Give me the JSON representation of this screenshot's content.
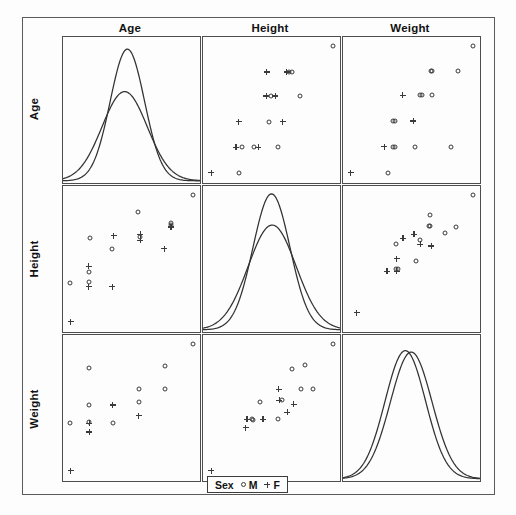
{
  "figure": {
    "title": "",
    "variables": [
      "Age",
      "Height",
      "Weight"
    ],
    "column_headers": [
      "Age",
      "Height",
      "Weight"
    ],
    "row_labels": [
      "Age",
      "Height",
      "Weight"
    ]
  },
  "legend": {
    "title": "Sex",
    "entries": [
      {
        "label": "M",
        "marker": "open-circle"
      },
      {
        "label": "F",
        "marker": "plus"
      }
    ]
  },
  "colors": {
    "frame": "#5a5a5a",
    "panel_border": "#4d4d4d",
    "curve": "#333333",
    "marker": "#3a3a3a",
    "background": "#fdfdfd",
    "text": "#111111"
  },
  "chart_data": {
    "type": "scatter",
    "title": "",
    "subtitle": "",
    "xlabel": "",
    "ylabel": "",
    "grid": false,
    "legend_position": "bottom-center",
    "matrix": {
      "kind": "scatterplot-matrix",
      "rows": 3,
      "cols": 3,
      "variables": [
        "Age",
        "Height",
        "Weight"
      ],
      "diagonal_plot": "density",
      "groups": [
        "M",
        "F"
      ]
    },
    "panels": [
      {
        "row": 0,
        "col": 0,
        "xvar": "Age",
        "yvar": "Age",
        "type": "density",
        "series": [
          {
            "name": "M",
            "marker": "open-circle",
            "peak_x": 0.47,
            "peak_y": 0.93,
            "sigma": 0.125
          },
          {
            "name": "F",
            "marker": "plus",
            "peak_x": 0.45,
            "peak_y": 0.63,
            "sigma": 0.165
          }
        ]
      },
      {
        "row": 0,
        "col": 1,
        "xvar": "Height",
        "yvar": "Age",
        "type": "scatter",
        "points": [
          {
            "x": 0.955,
            "y": 0.955,
            "g": "M"
          },
          {
            "x": 0.455,
            "y": 0.775,
            "g": "F"
          },
          {
            "x": 0.625,
            "y": 0.775,
            "g": "M"
          },
          {
            "x": 0.648,
            "y": 0.775,
            "g": "M"
          },
          {
            "x": 0.608,
            "y": 0.775,
            "g": "F"
          },
          {
            "x": 0.452,
            "y": 0.605,
            "g": "F"
          },
          {
            "x": 0.487,
            "y": 0.605,
            "g": "M"
          },
          {
            "x": 0.522,
            "y": 0.605,
            "g": "F"
          },
          {
            "x": 0.705,
            "y": 0.605,
            "g": "M"
          },
          {
            "x": 0.245,
            "y": 0.425,
            "g": "F"
          },
          {
            "x": 0.47,
            "y": 0.425,
            "g": "M"
          },
          {
            "x": 0.578,
            "y": 0.425,
            "g": "F"
          },
          {
            "x": 0.225,
            "y": 0.245,
            "g": "F"
          },
          {
            "x": 0.268,
            "y": 0.245,
            "g": "M"
          },
          {
            "x": 0.358,
            "y": 0.245,
            "g": "M"
          },
          {
            "x": 0.392,
            "y": 0.245,
            "g": "F"
          },
          {
            "x": 0.545,
            "y": 0.245,
            "g": "M"
          },
          {
            "x": 0.04,
            "y": 0.065,
            "g": "F"
          },
          {
            "x": 0.245,
            "y": 0.062,
            "g": "M"
          }
        ]
      },
      {
        "row": 0,
        "col": 2,
        "xvar": "Weight",
        "yvar": "Age",
        "type": "scatter",
        "points": [
          {
            "x": 0.955,
            "y": 0.955,
            "g": "M"
          },
          {
            "x": 0.638,
            "y": 0.78,
            "g": "M"
          },
          {
            "x": 0.648,
            "y": 0.78,
            "g": "M"
          },
          {
            "x": 0.845,
            "y": 0.78,
            "g": "M"
          },
          {
            "x": 0.425,
            "y": 0.61,
            "g": "F"
          },
          {
            "x": 0.56,
            "y": 0.61,
            "g": "M"
          },
          {
            "x": 0.57,
            "y": 0.61,
            "g": "M"
          },
          {
            "x": 0.645,
            "y": 0.61,
            "g": "M"
          },
          {
            "x": 0.355,
            "y": 0.43,
            "g": "M"
          },
          {
            "x": 0.365,
            "y": 0.43,
            "g": "M"
          },
          {
            "x": 0.505,
            "y": 0.43,
            "g": "F"
          },
          {
            "x": 0.288,
            "y": 0.25,
            "g": "F"
          },
          {
            "x": 0.352,
            "y": 0.25,
            "g": "M"
          },
          {
            "x": 0.368,
            "y": 0.25,
            "g": "M"
          },
          {
            "x": 0.518,
            "y": 0.25,
            "g": "M"
          },
          {
            "x": 0.79,
            "y": 0.25,
            "g": "M"
          },
          {
            "x": 0.035,
            "y": 0.065,
            "g": "F"
          },
          {
            "x": 0.318,
            "y": 0.062,
            "g": "M"
          }
        ]
      },
      {
        "row": 1,
        "col": 0,
        "xvar": "Age",
        "yvar": "Height",
        "type": "scatter",
        "points": [
          {
            "x": 0.955,
            "y": 0.955,
            "g": "M"
          },
          {
            "x": 0.545,
            "y": 0.835,
            "g": "M"
          },
          {
            "x": 0.79,
            "y": 0.745,
            "g": "M"
          },
          {
            "x": 0.79,
            "y": 0.758,
            "g": "M"
          },
          {
            "x": 0.79,
            "y": 0.732,
            "g": "F"
          },
          {
            "x": 0.178,
            "y": 0.655,
            "g": "M"
          },
          {
            "x": 0.358,
            "y": 0.672,
            "g": "F"
          },
          {
            "x": 0.558,
            "y": 0.66,
            "g": "M"
          },
          {
            "x": 0.558,
            "y": 0.64,
            "g": "F"
          },
          {
            "x": 0.558,
            "y": 0.68,
            "g": "F"
          },
          {
            "x": 0.345,
            "y": 0.58,
            "g": "M"
          },
          {
            "x": 0.74,
            "y": 0.58,
            "g": "F"
          },
          {
            "x": 0.172,
            "y": 0.455,
            "g": "F"
          },
          {
            "x": 0.172,
            "y": 0.418,
            "g": "M"
          },
          {
            "x": 0.172,
            "y": 0.348,
            "g": "M"
          },
          {
            "x": 0.172,
            "y": 0.312,
            "g": "F"
          },
          {
            "x": 0.348,
            "y": 0.312,
            "g": "F"
          },
          {
            "x": 0.03,
            "y": 0.335,
            "g": "M"
          },
          {
            "x": 0.035,
            "y": 0.065,
            "g": "F"
          }
        ]
      },
      {
        "row": 1,
        "col": 1,
        "xvar": "Height",
        "yvar": "Height",
        "type": "density",
        "series": [
          {
            "name": "M",
            "marker": "open-circle",
            "peak_x": 0.5,
            "peak_y": 0.96,
            "sigma": 0.135
          },
          {
            "name": "F",
            "marker": "plus",
            "peak_x": 0.505,
            "peak_y": 0.74,
            "sigma": 0.175
          }
        ]
      },
      {
        "row": 1,
        "col": 2,
        "xvar": "Weight",
        "yvar": "Height",
        "type": "scatter",
        "points": [
          {
            "x": 0.955,
            "y": 0.955,
            "g": "M"
          },
          {
            "x": 0.632,
            "y": 0.815,
            "g": "M"
          },
          {
            "x": 0.622,
            "y": 0.742,
            "g": "M"
          },
          {
            "x": 0.632,
            "y": 0.742,
            "g": "M"
          },
          {
            "x": 0.828,
            "y": 0.735,
            "g": "M"
          },
          {
            "x": 0.745,
            "y": 0.688,
            "g": "M"
          },
          {
            "x": 0.512,
            "y": 0.682,
            "g": "F"
          },
          {
            "x": 0.428,
            "y": 0.652,
            "g": "F"
          },
          {
            "x": 0.558,
            "y": 0.638,
            "g": "M"
          },
          {
            "x": 0.558,
            "y": 0.61,
            "g": "F"
          },
          {
            "x": 0.375,
            "y": 0.612,
            "g": "M"
          },
          {
            "x": 0.64,
            "y": 0.598,
            "g": "F"
          },
          {
            "x": 0.382,
            "y": 0.508,
            "g": "F"
          },
          {
            "x": 0.528,
            "y": 0.492,
            "g": "M"
          },
          {
            "x": 0.378,
            "y": 0.435,
            "g": "M"
          },
          {
            "x": 0.392,
            "y": 0.435,
            "g": "M"
          },
          {
            "x": 0.308,
            "y": 0.42,
            "g": "F"
          },
          {
            "x": 0.382,
            "y": 0.42,
            "g": "F"
          },
          {
            "x": 0.082,
            "y": 0.128,
            "g": "F"
          }
        ]
      },
      {
        "row": 2,
        "col": 0,
        "xvar": "Age",
        "yvar": "Weight",
        "type": "scatter",
        "points": [
          {
            "x": 0.955,
            "y": 0.955,
            "g": "M"
          },
          {
            "x": 0.175,
            "y": 0.79,
            "g": "M"
          },
          {
            "x": 0.742,
            "y": 0.8,
            "g": "M"
          },
          {
            "x": 0.548,
            "y": 0.642,
            "g": "M"
          },
          {
            "x": 0.742,
            "y": 0.642,
            "g": "M"
          },
          {
            "x": 0.548,
            "y": 0.552,
            "g": "M"
          },
          {
            "x": 0.175,
            "y": 0.528,
            "g": "M"
          },
          {
            "x": 0.352,
            "y": 0.528,
            "g": "F"
          },
          {
            "x": 0.548,
            "y": 0.452,
            "g": "F"
          },
          {
            "x": 0.175,
            "y": 0.408,
            "g": "M"
          },
          {
            "x": 0.175,
            "y": 0.398,
            "g": "F"
          },
          {
            "x": 0.352,
            "y": 0.402,
            "g": "M"
          },
          {
            "x": 0.03,
            "y": 0.402,
            "g": "M"
          },
          {
            "x": 0.175,
            "y": 0.338,
            "g": "F"
          },
          {
            "x": 0.035,
            "y": 0.065,
            "g": "F"
          }
        ]
      },
      {
        "row": 2,
        "col": 1,
        "xvar": "Height",
        "yvar": "Weight",
        "type": "scatter",
        "points": [
          {
            "x": 0.955,
            "y": 0.955,
            "g": "M"
          },
          {
            "x": 0.742,
            "y": 0.812,
            "g": "M"
          },
          {
            "x": 0.645,
            "y": 0.785,
            "g": "M"
          },
          {
            "x": 0.548,
            "y": 0.64,
            "g": "F"
          },
          {
            "x": 0.712,
            "y": 0.64,
            "g": "M"
          },
          {
            "x": 0.808,
            "y": 0.64,
            "g": "M"
          },
          {
            "x": 0.572,
            "y": 0.562,
            "g": "M"
          },
          {
            "x": 0.552,
            "y": 0.562,
            "g": "F"
          },
          {
            "x": 0.408,
            "y": 0.548,
            "g": "M"
          },
          {
            "x": 0.66,
            "y": 0.532,
            "g": "F"
          },
          {
            "x": 0.612,
            "y": 0.478,
            "g": "F"
          },
          {
            "x": 0.308,
            "y": 0.428,
            "g": "F"
          },
          {
            "x": 0.345,
            "y": 0.428,
            "g": "M"
          },
          {
            "x": 0.352,
            "y": 0.422,
            "g": "M"
          },
          {
            "x": 0.428,
            "y": 0.428,
            "g": "F"
          },
          {
            "x": 0.538,
            "y": 0.428,
            "g": "M"
          },
          {
            "x": 0.298,
            "y": 0.368,
            "g": "F"
          },
          {
            "x": 0.04,
            "y": 0.065,
            "g": "F"
          }
        ]
      },
      {
        "row": 2,
        "col": 2,
        "xvar": "Weight",
        "yvar": "Weight",
        "type": "density",
        "series": [
          {
            "name": "M",
            "marker": "open-circle",
            "peak_x": 0.455,
            "peak_y": 0.905,
            "sigma": 0.148
          },
          {
            "name": "F",
            "marker": "plus",
            "peak_x": 0.498,
            "peak_y": 0.895,
            "sigma": 0.152
          }
        ]
      }
    ]
  }
}
